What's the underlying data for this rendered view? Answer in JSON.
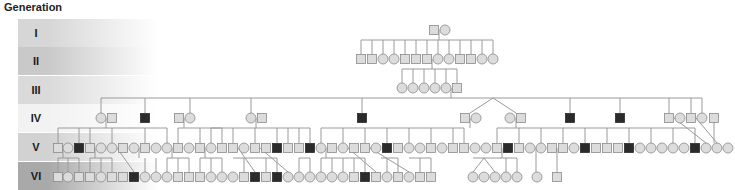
{
  "title": "Generation",
  "colors": {
    "fill": "#dcdcdc",
    "stroke": "#8a8a8a",
    "affected": "#2b2b2b",
    "line": "#9a9a9a"
  },
  "generations": [
    {
      "label": "I",
      "top": 19,
      "color": "#d6d6d6"
    },
    {
      "label": "II",
      "top": 47,
      "color": "#c9c9c9"
    },
    {
      "label": "III",
      "top": 76,
      "color": "#dadada"
    },
    {
      "label": "IV",
      "top": 104,
      "color": "#f2f2f2"
    },
    {
      "label": "V",
      "top": 133,
      "color": "#d2d2d2"
    },
    {
      "label": "VI",
      "top": 162,
      "color": "#a9a9a9"
    }
  ],
  "rows": {
    "I": {
      "y": 30,
      "people": [
        {
          "x": 434,
          "s": "m"
        },
        {
          "x": 445,
          "s": "f"
        }
      ]
    },
    "II": {
      "y": 59,
      "people": [
        {
          "x": 361,
          "s": "m"
        },
        {
          "x": 372,
          "s": "m"
        },
        {
          "x": 383,
          "s": "f"
        },
        {
          "x": 394,
          "s": "f"
        },
        {
          "x": 405,
          "s": "m"
        },
        {
          "x": 416,
          "s": "m"
        },
        {
          "x": 427,
          "s": "m"
        },
        {
          "x": 438,
          "s": "f"
        },
        {
          "x": 449,
          "s": "f"
        },
        {
          "x": 460,
          "s": "m"
        },
        {
          "x": 471,
          "s": "m"
        },
        {
          "x": 482,
          "s": "f"
        },
        {
          "x": 493,
          "s": "f"
        }
      ]
    },
    "III": {
      "y": 88,
      "people": [
        {
          "x": 402,
          "s": "f"
        },
        {
          "x": 413,
          "s": "f"
        },
        {
          "x": 424,
          "s": "f"
        },
        {
          "x": 435,
          "s": "f"
        },
        {
          "x": 446,
          "s": "f"
        },
        {
          "x": 457,
          "s": "m"
        }
      ]
    },
    "IV": {
      "y": 118,
      "people": [
        {
          "x": 101,
          "s": "f"
        },
        {
          "x": 112,
          "s": "m"
        },
        {
          "x": 145,
          "s": "m",
          "a": 1
        },
        {
          "x": 179,
          "s": "m"
        },
        {
          "x": 190,
          "s": "f"
        },
        {
          "x": 251,
          "s": "f"
        },
        {
          "x": 262,
          "s": "m"
        },
        {
          "x": 362,
          "s": "m",
          "a": 1
        },
        {
          "x": 465,
          "s": "m"
        },
        {
          "x": 476,
          "s": "f"
        },
        {
          "x": 510,
          "s": "f"
        },
        {
          "x": 521,
          "s": "m"
        },
        {
          "x": 570,
          "s": "m",
          "a": 1
        },
        {
          "x": 620,
          "s": "m",
          "a": 1
        },
        {
          "x": 669,
          "s": "m"
        },
        {
          "x": 680,
          "s": "f"
        },
        {
          "x": 691,
          "s": "m"
        },
        {
          "x": 702,
          "s": "f"
        },
        {
          "x": 714,
          "s": "m"
        }
      ]
    },
    "V": {
      "y": 148,
      "people": [
        {
          "x": 58,
          "s": "m"
        },
        {
          "x": 68,
          "s": "f"
        },
        {
          "x": 79,
          "s": "m",
          "a": 1
        },
        {
          "x": 90,
          "s": "m"
        },
        {
          "x": 101,
          "s": "f"
        },
        {
          "x": 112,
          "s": "f"
        },
        {
          "x": 123,
          "s": "m"
        },
        {
          "x": 134,
          "s": "f"
        },
        {
          "x": 145,
          "s": "m"
        },
        {
          "x": 156,
          "s": "f"
        },
        {
          "x": 167,
          "s": "f"
        },
        {
          "x": 178,
          "s": "m"
        },
        {
          "x": 189,
          "s": "f"
        },
        {
          "x": 200,
          "s": "m"
        },
        {
          "x": 211,
          "s": "f"
        },
        {
          "x": 222,
          "s": "m"
        },
        {
          "x": 233,
          "s": "m"
        },
        {
          "x": 244,
          "s": "f"
        },
        {
          "x": 255,
          "s": "m"
        },
        {
          "x": 266,
          "s": "m"
        },
        {
          "x": 277,
          "s": "m",
          "a": 1
        },
        {
          "x": 288,
          "s": "m"
        },
        {
          "x": 299,
          "s": "m"
        },
        {
          "x": 310,
          "s": "m",
          "a": 1
        },
        {
          "x": 321,
          "s": "f"
        },
        {
          "x": 332,
          "s": "m"
        },
        {
          "x": 343,
          "s": "f"
        },
        {
          "x": 354,
          "s": "m"
        },
        {
          "x": 365,
          "s": "m"
        },
        {
          "x": 376,
          "s": "f"
        },
        {
          "x": 387,
          "s": "m",
          "a": 1
        },
        {
          "x": 398,
          "s": "m"
        },
        {
          "x": 409,
          "s": "f"
        },
        {
          "x": 420,
          "s": "f"
        },
        {
          "x": 431,
          "s": "m"
        },
        {
          "x": 442,
          "s": "f"
        },
        {
          "x": 453,
          "s": "m"
        },
        {
          "x": 464,
          "s": "m"
        },
        {
          "x": 475,
          "s": "f"
        },
        {
          "x": 486,
          "s": "f"
        },
        {
          "x": 497,
          "s": "m"
        },
        {
          "x": 508,
          "s": "m",
          "a": 1
        },
        {
          "x": 519,
          "s": "m"
        },
        {
          "x": 530,
          "s": "f"
        },
        {
          "x": 541,
          "s": "f"
        },
        {
          "x": 552,
          "s": "m"
        },
        {
          "x": 563,
          "s": "m"
        },
        {
          "x": 574,
          "s": "f"
        },
        {
          "x": 585,
          "s": "m",
          "a": 1
        },
        {
          "x": 596,
          "s": "m"
        },
        {
          "x": 607,
          "s": "m"
        },
        {
          "x": 618,
          "s": "m"
        },
        {
          "x": 629,
          "s": "m",
          "a": 1
        },
        {
          "x": 640,
          "s": "f"
        },
        {
          "x": 651,
          "s": "f"
        },
        {
          "x": 662,
          "s": "f"
        },
        {
          "x": 673,
          "s": "f"
        },
        {
          "x": 684,
          "s": "f"
        },
        {
          "x": 695,
          "s": "m",
          "a": 1
        },
        {
          "x": 706,
          "s": "f"
        },
        {
          "x": 717,
          "s": "f"
        },
        {
          "x": 728,
          "s": "f"
        }
      ]
    },
    "VI": {
      "y": 177,
      "people": [
        {
          "x": 58,
          "s": "m"
        },
        {
          "x": 68,
          "s": "f"
        },
        {
          "x": 79,
          "s": "m"
        },
        {
          "x": 90,
          "s": "m"
        },
        {
          "x": 101,
          "s": "f"
        },
        {
          "x": 112,
          "s": "m"
        },
        {
          "x": 123,
          "s": "m"
        },
        {
          "x": 134,
          "s": "m",
          "a": 1
        },
        {
          "x": 145,
          "s": "f"
        },
        {
          "x": 156,
          "s": "f"
        },
        {
          "x": 167,
          "s": "f"
        },
        {
          "x": 178,
          "s": "m"
        },
        {
          "x": 189,
          "s": "m"
        },
        {
          "x": 200,
          "s": "m"
        },
        {
          "x": 211,
          "s": "f"
        },
        {
          "x": 222,
          "s": "f"
        },
        {
          "x": 233,
          "s": "f"
        },
        {
          "x": 244,
          "s": "m"
        },
        {
          "x": 255,
          "s": "m",
          "a": 1
        },
        {
          "x": 266,
          "s": "m"
        },
        {
          "x": 277,
          "s": "m",
          "a": 1
        },
        {
          "x": 288,
          "s": "f"
        },
        {
          "x": 299,
          "s": "f"
        },
        {
          "x": 310,
          "s": "f"
        },
        {
          "x": 321,
          "s": "f"
        },
        {
          "x": 332,
          "s": "f"
        },
        {
          "x": 343,
          "s": "f"
        },
        {
          "x": 354,
          "s": "m"
        },
        {
          "x": 365,
          "s": "m",
          "a": 1
        },
        {
          "x": 376,
          "s": "m"
        },
        {
          "x": 387,
          "s": "f"
        },
        {
          "x": 398,
          "s": "m"
        },
        {
          "x": 409,
          "s": "f"
        },
        {
          "x": 420,
          "s": "m"
        },
        {
          "x": 431,
          "s": "m"
        },
        {
          "x": 473,
          "s": "f"
        },
        {
          "x": 484,
          "s": "f"
        },
        {
          "x": 495,
          "s": "f"
        },
        {
          "x": 506,
          "s": "f"
        },
        {
          "x": 517,
          "s": "f"
        },
        {
          "x": 537,
          "s": "f"
        },
        {
          "x": 557,
          "s": "m"
        }
      ]
    }
  },
  "lines": [
    "M439 30 V40 M361 40 H493 M361 40 V54 M372 40 V54 M383 40 V54 M394 40 V54 M405 40 V54 M416 40 V54 M427 40 V54 M438 40 V54 M449 40 V54 M460 40 V54 M471 40 V54 M482 40 V54 M493 40 V54",
    "M432 59 V69 M402 69 H457 M402 69 V83 M413 69 V83 M424 69 V83 M435 69 V83 M446 69 V83 M457 69 V83",
    "M451 88 V98 M101 98 H702 M101 98 V113 M145 98 V113 M190 98 V113 M251 98 V113 M362 98 V113 M470 113 L493 98 L516 113 M570 98 V113 M620 98 V113 M669 98 V113 M691 98 V113 M702 98 V113",
    "M106 118 V128 M58 128 H167 M58 128 V143 M79 128 V143 M90 128 V143 M112 128 V143 M145 128 V143 M167 128 V143",
    "M184 118 V128 M178 128 H222 M178 128 V143 M200 128 V143 M222 128 V143",
    "M256 118 V128 M211 128 H310 M211 128 V143 M233 128 V143 M255 128 V143 M277 128 V143 M288 128 V143 M299 128 V143 M310 128 V143",
    "M470 118 V128 M321 128 H464 M321 128 V143 M343 128 V143 M365 128 V143 M387 128 V143 M409 128 V143 M431 128 V143 M453 128 V143 M464 128 V143",
    "M516 118 V128 M497 128 H695 M497 128 V143 M519 128 V143 M541 128 V143 M563 128 V143 M585 128 V143 M607 128 V143 M629 128 V143 M651 128 V143 M673 128 V143 M695 128 V143",
    "M674 118 L706 143 M696 118 L717 143 M714 118 V143",
    "M63 148 V158 M58 158 H79 M58 158 V172 M68 158 V172 M79 158 V172",
    "M95 148 V158 M90 158 H112 M90 158 V172 M101 158 V172 M112 158 V172",
    "M117 148 L134 172 M139 148 V158 M145 158 V172 M156 158 V172",
    "M172 148 V158 M167 158 H189 M167 158 V172 M178 158 V172 M189 158 V172",
    "M205 148 V158 M200 158 H222 M200 158 V172 M211 158 V172 M222 158 V172",
    "M238 148 L255 172 M233 158 H277 M244 158 V172 M266 158 V172 M277 158 V172",
    "M260 148 L288 172 M299 158 H310 M299 158 V172 M310 158 V172",
    "M326 148 V158 M321 158 H365 M321 158 V172 M332 158 V172 M343 158 V172 M354 158 V172 M365 158 V172",
    "M348 148 L376 172 M381 158 H398 M387 158 V172 M398 158 V172",
    "M370 148 L409 172 M409 158 H431 M420 158 V172 M431 158 V172",
    "M502 148 V158 M473 158 H517 M473 172 L484 158 L495 172 M506 158 V172 M517 158 V172",
    "M536 148 V172 M557 148 V172"
  ]
}
